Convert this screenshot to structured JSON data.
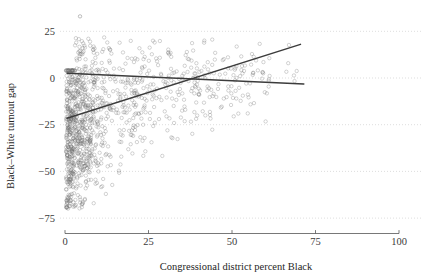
{
  "chart_data": {
    "type": "scatter",
    "title": "",
    "subtitle": "",
    "xlabel": "Congressional district percent Black",
    "ylabel": "Black–White turnout gap",
    "xlim": [
      -3,
      104
    ],
    "ylim": [
      -80,
      36
    ],
    "xticks": [
      0,
      25,
      50,
      75,
      100
    ],
    "xticklabels": [
      "0",
      "25",
      "50",
      "75",
      "100"
    ],
    "yticks": [
      25,
      0,
      -25,
      -50,
      -75
    ],
    "yticklabels": [
      "25",
      "0",
      "−25",
      "−50",
      "−75"
    ],
    "grid": "horizontal-dotted",
    "legend": "none",
    "marker": {
      "shape": "open-circle",
      "radius_px": 1.7,
      "color": "#6e6e6e",
      "opacity": 0.55
    },
    "series": [
      {
        "name": "Congressional districts",
        "n_points": 1150,
        "description": "Dense left cluster at low percent Black with large negative turnout gaps; gap narrows toward zero as percent Black rises.",
        "density_model": {
          "x_distribution": "right-skewed, mode near 4, long tail to 70",
          "y_given_x": "mean rises from about -32 at x=0 to about -2 at x=55, spread shrinks from 18 to 9"
        }
      }
    ],
    "fit_lines": [
      {
        "name": "steep-fit",
        "x_start": 0.6,
        "y_start": -21.5,
        "x_end": 70.5,
        "y_end": 18.0,
        "style": "solid",
        "color": "#3c3c3c"
      },
      {
        "name": "flat-fit",
        "x_start": 0.6,
        "y_start": 2.6,
        "x_end": 71.5,
        "y_end": -3.2,
        "style": "solid",
        "color": "#3c3c3c"
      }
    ],
    "annotations": [
      {
        "label": "high outlier",
        "x": 4.5,
        "y": 33.0
      }
    ],
    "colors": {
      "background": "#ffffff",
      "point": "#6e6e6e",
      "grid": "#c9c9c9",
      "axis": "#555555",
      "text": "#2b2b2b",
      "fit": "#3c3c3c"
    }
  }
}
